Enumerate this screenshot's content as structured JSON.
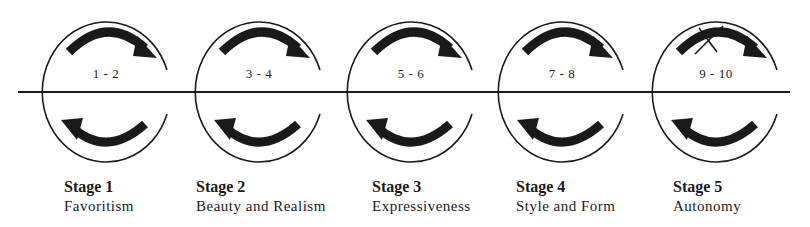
{
  "stages": [
    {
      "title": "Stage 1",
      "subtitle": "Favoritism",
      "range": "1 - 2",
      "cx": 107,
      "crossed": false,
      "label_x": 64
    },
    {
      "title": "Stage 2",
      "subtitle": "Beauty and Realism",
      "range": "3 - 4",
      "cx": 260,
      "crossed": false,
      "label_x": 196
    },
    {
      "title": "Stage 3",
      "subtitle": "Expressiveness",
      "range": "5 - 6",
      "cx": 412,
      "crossed": false,
      "label_x": 372
    },
    {
      "title": "Stage 4",
      "subtitle": "Style and Form",
      "range": "7 - 8",
      "cx": 563,
      "crossed": false,
      "label_x": 516
    },
    {
      "title": "Stage 5",
      "subtitle": "Autonomy",
      "range": "9 - 10",
      "cx": 717,
      "crossed": true,
      "label_x": 673
    }
  ],
  "colors": {
    "ink": "#1a1a1a",
    "background": "#ffffff"
  }
}
